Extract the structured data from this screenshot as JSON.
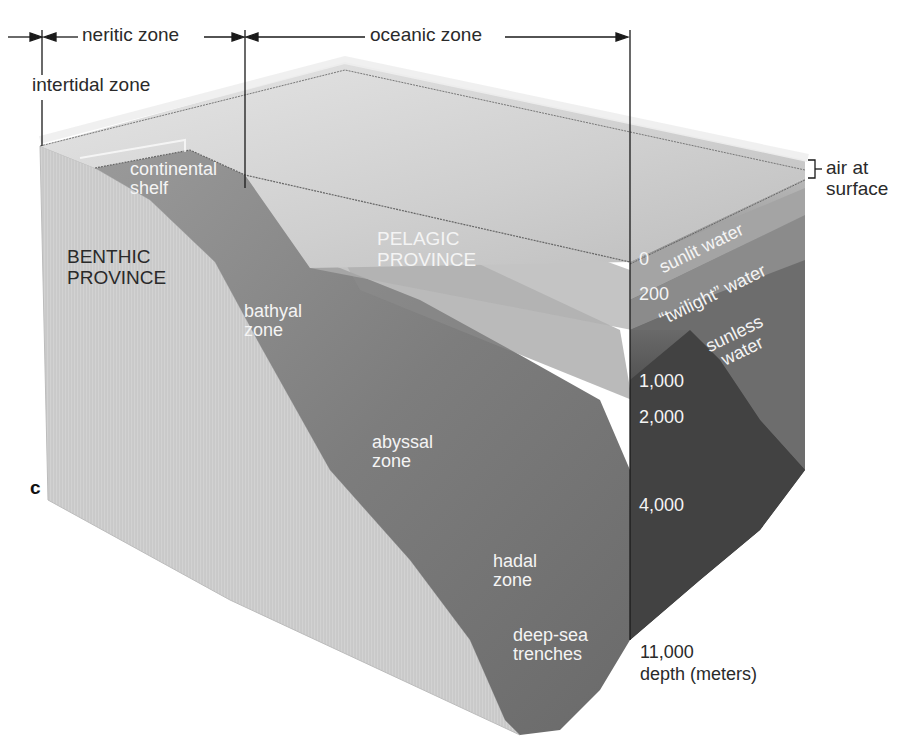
{
  "figure": {
    "panel_label": "c",
    "top_zones": {
      "neritic": "neritic zone",
      "oceanic": "oceanic zone",
      "intertidal": "intertidal zone"
    },
    "air_label": [
      "air at",
      "surface"
    ],
    "provinces": {
      "benthic": [
        "BENTHIC",
        "PROVINCE"
      ],
      "pelagic": [
        "PELAGIC",
        "PROVINCE"
      ]
    },
    "floor_zones": {
      "continental_shelf": [
        "continental",
        "shelf"
      ],
      "bathyal": [
        "bathyal",
        "zone"
      ],
      "abyssal": [
        "abyssal",
        "zone"
      ],
      "hadal": [
        "hadal",
        "zone"
      ],
      "trenches": [
        "deep-sea",
        "trenches"
      ]
    },
    "water_layers": {
      "sunlit": "sunlit water",
      "twilight": "“twilight” water",
      "sunless": [
        "sunless",
        "water"
      ]
    },
    "depth_scale": {
      "ticks": [
        "0",
        "200",
        "1,000",
        "2,000",
        "4,000",
        "11,000"
      ],
      "unit_label": "depth (meters)"
    },
    "colors": {
      "background": "#ffffff",
      "surface_water": "#dcdcdc",
      "sunlit_layer": "#a8a8a8",
      "twilight_layer": "#8a8a8a",
      "sunless_layer": "#5e5e5e",
      "deep_water": "#3f3f3f",
      "seafloor": "#7a7a7a",
      "cross_section": "#cfcfcf",
      "text_dark": "#2a2a2a",
      "text_light": "#f4f4f4"
    }
  }
}
